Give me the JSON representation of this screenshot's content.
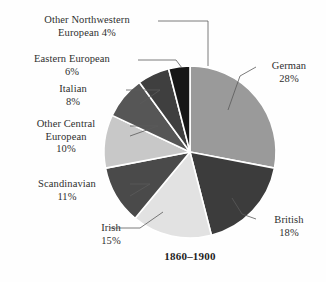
{
  "chart_data": {
    "type": "pie",
    "title": "1860–1900",
    "xlabel": "",
    "ylabel": "",
    "legend_position": "none",
    "labels_position": "outside-with-leader-lines",
    "grid": false,
    "units": "percent",
    "total": 100,
    "start_angle_deg": 0,
    "direction": "clockwise",
    "categories": [
      "German",
      "British",
      "Irish",
      "Scandinavian",
      "Other Central European",
      "Italian",
      "Eastern European",
      "Other Northwestern European"
    ],
    "values": [
      28,
      18,
      15,
      11,
      10,
      8,
      6,
      4
    ],
    "slices": [
      {
        "name": "German",
        "value": 28,
        "value_label": "28%",
        "label_lines": [
          "German",
          "28%"
        ],
        "color": "#9a9a9a",
        "start_deg": 0,
        "end_deg": 100.8
      },
      {
        "name": "British",
        "value": 18,
        "value_label": "18%",
        "label_lines": [
          "British",
          "18%"
        ],
        "color": "#3c3c3c",
        "start_deg": 100.8,
        "end_deg": 165.6
      },
      {
        "name": "Irish",
        "value": 15,
        "value_label": "15%",
        "label_lines": [
          "Irish",
          "15%"
        ],
        "color": "#e2e2e2",
        "start_deg": 165.6,
        "end_deg": 219.6
      },
      {
        "name": "Scandinavian",
        "value": 11,
        "value_label": "11%",
        "label_lines": [
          "Scandinavian",
          "11%"
        ],
        "color": "#4a4a4a",
        "start_deg": 219.6,
        "end_deg": 259.2
      },
      {
        "name": "Other Central European",
        "value": 10,
        "value_label": "10%",
        "label_lines": [
          "Other Central",
          "European",
          "10%"
        ],
        "color": "#c8c8c8",
        "start_deg": 259.2,
        "end_deg": 295.2
      },
      {
        "name": "Italian",
        "value": 8,
        "value_label": "8%",
        "label_lines": [
          "Italian",
          "8%"
        ],
        "color": "#565656",
        "start_deg": 295.2,
        "end_deg": 324.0
      },
      {
        "name": "Eastern European",
        "value": 6,
        "value_label": "6%",
        "label_lines": [
          "Eastern European",
          "6%"
        ],
        "color": "#3f3f3f",
        "start_deg": 324.0,
        "end_deg": 345.6
      },
      {
        "name": "Other Northwestern European",
        "value": 4,
        "value_label": "4%",
        "label_lines": [
          "Other Northwestern",
          "European 4%"
        ],
        "color": "#171717",
        "start_deg": 345.6,
        "end_deg": 360.0
      }
    ],
    "geometry": {
      "center_x": 190,
      "center_y": 152,
      "radius": 86,
      "separator_color": "#ffffff",
      "separator_width": 1.6
    }
  }
}
